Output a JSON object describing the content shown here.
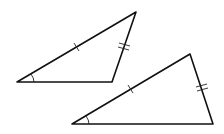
{
  "diagram": {
    "colors": {
      "stroke": "#111111",
      "background": "#ffffff"
    },
    "triangles": [
      {
        "name": "triangle-1",
        "vertices": {
          "A": [
            17,
            82
          ],
          "B": [
            136,
            12
          ],
          "C": [
            112,
            82
          ]
        },
        "marks": {
          "single_tick_side": "AB",
          "double_tick_side": "BC",
          "angle_arc_vertex": "A"
        }
      },
      {
        "name": "triangle-2",
        "vertices": {
          "D": [
            72,
            124
          ],
          "E": [
            190,
            54
          ],
          "F": [
            213,
            124
          ]
        },
        "marks": {
          "single_tick_side": "DE",
          "double_tick_side": "EF",
          "angle_arc_vertex": "D"
        }
      }
    ]
  }
}
